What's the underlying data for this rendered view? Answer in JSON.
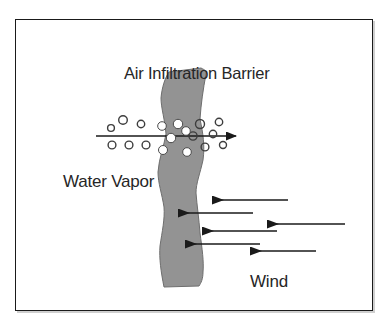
{
  "figure": {
    "kind": "technical-illustration",
    "title": "Air Infiltration Barrier",
    "labels": {
      "title": "Air Infiltration Barrier",
      "water_vapor": "Water Vapor",
      "wind": "Wind"
    },
    "colors": {
      "page_background": "#ffffff",
      "frame_border": "#1a1a1a",
      "barrier_fill": "#939393",
      "barrier_stroke": "#5a5a5a",
      "text": "#262626",
      "arrow": "#1a1a1a",
      "droplet_outline": "#3d3d3d",
      "droplet_fill_on_barrier": "#ffffff"
    },
    "frame": {
      "x": 15,
      "y": 19,
      "width": 358,
      "height": 292,
      "stroke_width": 1.6
    },
    "barrier": {
      "name": "air-infiltration-barrier-membrane",
      "description": "wavy vertical gray membrane",
      "path": "M 201,68 L 206,72 L 204,96 L 200,120 L 204,144 L 202,168 L 196,190 L 198,214 L 200,240 L 203,262 L 200,282 L 163,287 L 160,262 L 164,238 L 161,214 L 158,190 L 163,166 L 166,142 L 161,118 L 163,94 L 168,78 Z"
    },
    "water_vapor_flow": {
      "name": "water-vapor-arrow",
      "direction": "left-to-right",
      "line": {
        "x1": 96,
        "y1": 136,
        "x2": 236,
        "y2": 136
      },
      "arrowhead": {
        "x": 248,
        "y": 136
      },
      "droplets": [
        {
          "cx": 111,
          "cy": 128,
          "r": 3.4,
          "filled": false
        },
        {
          "cx": 122,
          "cy": 121,
          "r": 4.2,
          "filled": false
        },
        {
          "cx": 112,
          "cy": 144,
          "r": 3.8,
          "filled": false
        },
        {
          "cx": 129,
          "cy": 144,
          "r": 3.8,
          "filled": false
        },
        {
          "cx": 140,
          "cy": 125,
          "r": 3.6,
          "filled": false
        },
        {
          "cx": 146,
          "cy": 144,
          "r": 3.8,
          "filled": false
        },
        {
          "cx": 162,
          "cy": 126,
          "r": 4.2,
          "filled": true
        },
        {
          "cx": 177,
          "cy": 124,
          "r": 4.6,
          "filled": true
        },
        {
          "cx": 170,
          "cy": 138,
          "r": 4.6,
          "filled": true
        },
        {
          "cx": 163,
          "cy": 149,
          "r": 4.4,
          "filled": true
        },
        {
          "cx": 186,
          "cy": 152,
          "r": 4.2,
          "filled": true
        },
        {
          "cx": 192,
          "cy": 137,
          "r": 4.0,
          "filled": false
        },
        {
          "cx": 199,
          "cy": 124,
          "r": 4.4,
          "filled": false
        },
        {
          "cx": 204,
          "cy": 146,
          "r": 3.8,
          "filled": false
        },
        {
          "cx": 212,
          "cy": 134,
          "r": 3.6,
          "filled": false
        },
        {
          "cx": 218,
          "cy": 123,
          "r": 3.6,
          "filled": false
        },
        {
          "cx": 222,
          "cy": 144,
          "r": 3.4,
          "filled": false
        }
      ]
    },
    "wind_flow": {
      "name": "wind-arrows",
      "direction": "right-to-left",
      "arrows": [
        {
          "tip_x": 211,
          "tip_y": 200,
          "tail_x": 288,
          "y": 200
        },
        {
          "tip_x": 177,
          "tip_y": 213,
          "tail_x": 253,
          "y": 213
        },
        {
          "tip_x": 266,
          "tip_y": 224,
          "tail_x": 345,
          "y": 224
        },
        {
          "tip_x": 201,
          "tip_y": 231,
          "tail_x": 277,
          "y": 231
        },
        {
          "tip_x": 184,
          "tip_y": 244,
          "tail_x": 260,
          "y": 244
        },
        {
          "tip_x": 249,
          "tip_y": 251,
          "tail_x": 316,
          "y": 251
        }
      ]
    }
  }
}
